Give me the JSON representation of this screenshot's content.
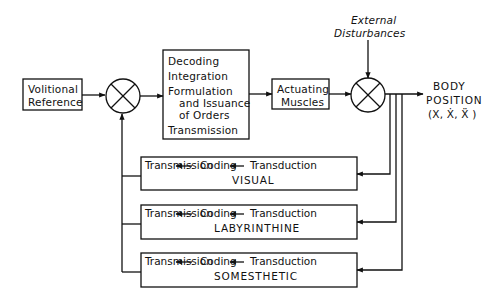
{
  "diagram": {
    "blocks": {
      "volitional": {
        "line1": "Volitional",
        "line2": "Reference"
      },
      "central": {
        "l1": "Decoding",
        "l2": "Integration",
        "l3": "Formulation",
        "l4": "and Issuance",
        "l5": "of Orders",
        "l6": "Transmission"
      },
      "muscles": {
        "line1": "Actuating",
        "line2": "Muscles"
      },
      "disturbance": {
        "line1": "External",
        "line2": "Disturbances"
      },
      "output": {
        "line1": "BODY",
        "line2": "POSITION",
        "line3": "(X, Ẋ, Ẍ )"
      }
    },
    "feedback": [
      {
        "transmission": "Transmission",
        "coding": "Coding",
        "transduction": "Transduction",
        "name": "VISUAL"
      },
      {
        "transmission": "Transmission",
        "coding": "Coding",
        "transduction": "Transduction",
        "name": "LABYRINTHINE"
      },
      {
        "transmission": "Transmission",
        "coding": "Coding",
        "transduction": "Transduction",
        "name": "SOMESTHETIC"
      }
    ]
  }
}
